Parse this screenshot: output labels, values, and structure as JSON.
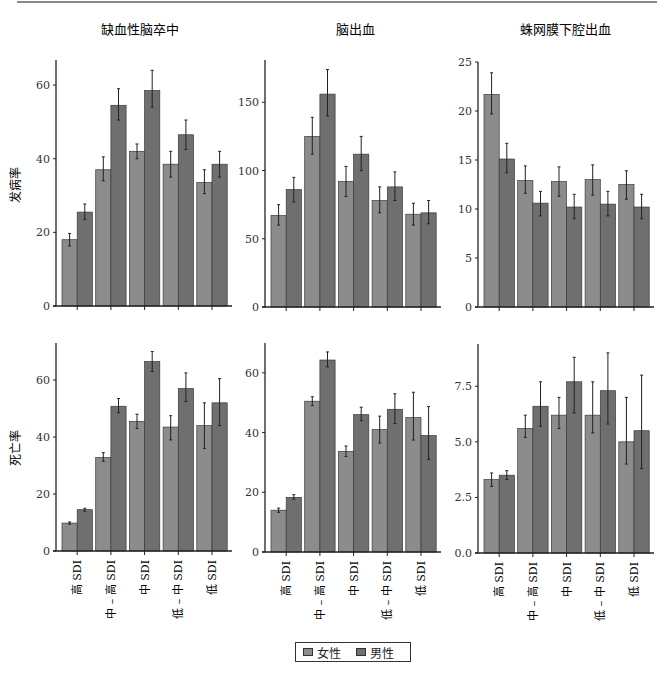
{
  "legend": {
    "female_label": "女性",
    "male_label": "男性",
    "female_color": "#8c8c8c",
    "male_color": "#6f6f6f"
  },
  "row_labels": [
    "发病率",
    "死亡率"
  ],
  "column_titles": [
    "缺血性脑卒中",
    "脑出血",
    "蛛网膜下腔出血"
  ],
  "chart_data": [
    {
      "type": "bar",
      "title": "缺血性脑卒中",
      "ylabel": "发病率",
      "xlabel": "",
      "categories": [
        "高 SDI",
        "中 – 高 SDI",
        "中 SDI",
        "低 – 中 SDI",
        "低 SDI"
      ],
      "yticks": [
        0,
        20,
        40,
        60
      ],
      "ylim": [
        0,
        66.8
      ],
      "series": [
        {
          "name": "女性",
          "values": [
            18.0,
            37.0,
            42.0,
            38.5,
            33.5
          ],
          "lower": [
            16.3,
            34.0,
            40.0,
            35.0,
            30.5
          ],
          "upper": [
            19.7,
            40.5,
            44.0,
            42.0,
            37.0
          ]
        },
        {
          "name": "男性",
          "values": [
            25.5,
            54.5,
            58.5,
            46.5,
            38.5
          ],
          "lower": [
            23.5,
            50.5,
            54.0,
            42.5,
            35.0
          ],
          "upper": [
            27.7,
            59.0,
            64.0,
            50.5,
            42.0
          ]
        }
      ]
    },
    {
      "type": "bar",
      "title": "脑出血",
      "ylabel": "",
      "xlabel": "",
      "categories": [
        "高 SDI",
        "中 – 高 SDI",
        "中 SDI",
        "低 – 中 SDI",
        "低 SDI"
      ],
      "yticks": [
        0,
        50,
        100,
        150
      ],
      "ylim": [
        0,
        181
      ],
      "series": [
        {
          "name": "女性",
          "values": [
            67,
            125,
            92,
            78,
            68
          ],
          "lower": [
            60,
            112,
            81,
            69,
            60
          ],
          "upper": [
            75,
            139,
            103,
            88,
            76
          ]
        },
        {
          "name": "男性",
          "values": [
            86,
            156,
            112,
            88,
            69
          ],
          "lower": [
            77,
            140,
            100,
            78,
            61
          ],
          "upper": [
            95,
            174,
            125,
            99,
            78
          ]
        }
      ]
    },
    {
      "type": "bar",
      "title": "蛛网膜下腔出血",
      "ylabel": "",
      "xlabel": "",
      "categories": [
        "高 SDI",
        "中 – 高 SDI",
        "中 SDI",
        "低 – 中 SDI",
        "低 SDI"
      ],
      "yticks": [
        0,
        5,
        10,
        15,
        20,
        25
      ],
      "ylim": [
        0,
        25
      ],
      "series": [
        {
          "name": "女性",
          "values": [
            21.7,
            12.9,
            12.8,
            13.0,
            12.5
          ],
          "lower": [
            19.7,
            11.6,
            11.3,
            11.4,
            11.0
          ],
          "upper": [
            23.9,
            14.4,
            14.3,
            14.5,
            13.9
          ]
        },
        {
          "name": "男性",
          "values": [
            15.1,
            10.6,
            10.2,
            10.5,
            10.2
          ],
          "lower": [
            13.7,
            9.3,
            9.0,
            9.3,
            9.0
          ],
          "upper": [
            16.7,
            11.8,
            11.5,
            11.8,
            11.5
          ]
        }
      ]
    },
    {
      "type": "bar",
      "title": "",
      "ylabel": "死亡率",
      "xlabel": "",
      "categories": [
        "高 SDI",
        "中 – 高 SDI",
        "中 SDI",
        "低 – 中 SDI",
        "低 SDI"
      ],
      "yticks": [
        0,
        20,
        40,
        60
      ],
      "ylim": [
        0,
        73
      ],
      "series": [
        {
          "name": "女性",
          "values": [
            9.8,
            32.8,
            45.5,
            43.5,
            44.0
          ],
          "lower": [
            9.4,
            31.5,
            43.0,
            39.0,
            36.0
          ],
          "upper": [
            10.2,
            34.5,
            48.0,
            47.5,
            52.0
          ]
        },
        {
          "name": "男性",
          "values": [
            14.5,
            50.8,
            66.5,
            57.0,
            52.0
          ],
          "lower": [
            14.0,
            48.5,
            63.0,
            52.5,
            44.0
          ],
          "upper": [
            15.0,
            53.5,
            70.0,
            62.5,
            60.5
          ]
        }
      ]
    },
    {
      "type": "bar",
      "title": "",
      "ylabel": "",
      "xlabel": "",
      "categories": [
        "高 SDI",
        "中 – 高 SDI",
        "中 SDI",
        "低 – 中 SDI",
        "低 SDI"
      ],
      "yticks": [
        0,
        20,
        40,
        60
      ],
      "ylim": [
        0,
        70
      ],
      "series": [
        {
          "name": "女性",
          "values": [
            14.0,
            50.5,
            33.7,
            41.0,
            45.0
          ],
          "lower": [
            13.3,
            49.0,
            32.0,
            36.5,
            37.5
          ],
          "upper": [
            14.7,
            52.0,
            35.5,
            45.5,
            53.5
          ]
        },
        {
          "name": "男性",
          "values": [
            18.3,
            64.3,
            46.0,
            47.8,
            39.0
          ],
          "lower": [
            17.7,
            62.0,
            44.0,
            43.0,
            31.0
          ],
          "upper": [
            19.2,
            67.0,
            48.5,
            53.0,
            48.7
          ]
        }
      ]
    },
    {
      "type": "bar",
      "title": "",
      "ylabel": "",
      "xlabel": "",
      "categories": [
        "高 SDI",
        "中 – 高 SDI",
        "中 SDI",
        "低 – 中 SDI",
        "低 SDI"
      ],
      "yticks": [
        "0.0",
        "2.5",
        "5.0",
        "7.5"
      ],
      "ylim": [
        0,
        9.4
      ],
      "series": [
        {
          "name": "女性",
          "values": [
            3.3,
            5.6,
            6.2,
            6.2,
            5.0
          ],
          "lower": [
            3.0,
            5.2,
            5.6,
            5.4,
            4.0
          ],
          "upper": [
            3.6,
            6.2,
            7.0,
            7.7,
            7.0
          ]
        },
        {
          "name": "男性",
          "values": [
            3.5,
            6.6,
            7.7,
            7.3,
            5.5
          ],
          "lower": [
            3.3,
            5.7,
            6.3,
            5.8,
            3.8
          ],
          "upper": [
            3.7,
            7.7,
            8.8,
            9.0,
            8.0
          ]
        }
      ]
    }
  ]
}
